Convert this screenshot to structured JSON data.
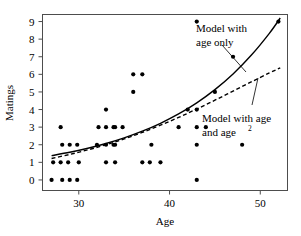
{
  "chart_data": {
    "type": "scatter",
    "title": "",
    "xlabel": "Age",
    "ylabel": "Matings",
    "xlim": [
      26,
      53
    ],
    "ylim": [
      -0.6,
      9.4
    ],
    "xticks": [
      30,
      40,
      50
    ],
    "xtick_labels": [
      "30",
      "40",
      "50"
    ],
    "yticks": [
      0,
      1,
      2,
      3,
      4,
      5,
      6,
      7,
      8,
      9
    ],
    "ytick_labels": [
      "0",
      "1",
      "2",
      "3",
      "4",
      "5",
      "6",
      "7",
      "8",
      "9"
    ],
    "grid": false,
    "legend": "annotations",
    "points": [
      {
        "x": 27,
        "y": 0
      },
      {
        "x": 28,
        "y": 1
      },
      {
        "x": 28,
        "y": 1
      },
      {
        "x": 28,
        "y": 1
      },
      {
        "x": 28,
        "y": 3
      },
      {
        "x": 29,
        "y": 0
      },
      {
        "x": 29,
        "y": 0
      },
      {
        "x": 29,
        "y": 0
      },
      {
        "x": 29,
        "y": 2
      },
      {
        "x": 29,
        "y": 2
      },
      {
        "x": 29,
        "y": 2
      },
      {
        "x": 30,
        "y": 1
      },
      {
        "x": 32,
        "y": 2
      },
      {
        "x": 33,
        "y": 4
      },
      {
        "x": 33,
        "y": 3
      },
      {
        "x": 33,
        "y": 3
      },
      {
        "x": 33,
        "y": 3
      },
      {
        "x": 33,
        "y": 2
      },
      {
        "x": 33,
        "y": 2
      },
      {
        "x": 33,
        "y": 1
      },
      {
        "x": 34,
        "y": 1
      },
      {
        "x": 34,
        "y": 2
      },
      {
        "x": 34,
        "y": 3
      },
      {
        "x": 34,
        "y": 3
      },
      {
        "x": 36,
        "y": 5
      },
      {
        "x": 36,
        "y": 6
      },
      {
        "x": 37,
        "y": 1
      },
      {
        "x": 37,
        "y": 1
      },
      {
        "x": 37,
        "y": 6
      },
      {
        "x": 38,
        "y": 2
      },
      {
        "x": 39,
        "y": 1
      },
      {
        "x": 41,
        "y": 3
      },
      {
        "x": 42,
        "y": 4
      },
      {
        "x": 43,
        "y": 0
      },
      {
        "x": 43,
        "y": 2
      },
      {
        "x": 43,
        "y": 3
      },
      {
        "x": 43,
        "y": 4
      },
      {
        "x": 43,
        "y": 9
      },
      {
        "x": 44,
        "y": 3
      },
      {
        "x": 45,
        "y": 5
      },
      {
        "x": 47,
        "y": 7
      },
      {
        "x": 48,
        "y": 2
      },
      {
        "x": 52,
        "y": 9
      }
    ],
    "curves": [
      {
        "name": "Model with age only",
        "style": "solid",
        "label_lines": [
          "Model with",
          "age only"
        ],
        "xrange": [
          27.0,
          52.2
        ],
        "points": [
          {
            "x": 27.0,
            "y": 1.38
          },
          {
            "x": 29.0,
            "y": 1.57
          },
          {
            "x": 31.0,
            "y": 1.8
          },
          {
            "x": 33.0,
            "y": 2.07
          },
          {
            "x": 35.0,
            "y": 2.39
          },
          {
            "x": 37.0,
            "y": 2.77
          },
          {
            "x": 39.0,
            "y": 3.22
          },
          {
            "x": 41.0,
            "y": 3.75
          },
          {
            "x": 43.0,
            "y": 4.38
          },
          {
            "x": 45.0,
            "y": 5.13
          },
          {
            "x": 47.0,
            "y": 6.02
          },
          {
            "x": 49.0,
            "y": 7.08
          },
          {
            "x": 51.0,
            "y": 8.33
          },
          {
            "x": 52.2,
            "y": 9.2
          }
        ]
      },
      {
        "name": "Model with age and age squared",
        "style": "dashed",
        "label_lines": [
          "Model with age",
          "and age"
        ],
        "label_superscript": "2",
        "xrange": [
          27.0,
          52.2
        ],
        "points": [
          {
            "x": 27.0,
            "y": 1.22
          },
          {
            "x": 29.0,
            "y": 1.45
          },
          {
            "x": 31.0,
            "y": 1.71
          },
          {
            "x": 33.0,
            "y": 2.0
          },
          {
            "x": 35.0,
            "y": 2.33
          },
          {
            "x": 37.0,
            "y": 2.7
          },
          {
            "x": 39.0,
            "y": 3.11
          },
          {
            "x": 41.0,
            "y": 3.55
          },
          {
            "x": 43.0,
            "y": 4.03
          },
          {
            "x": 45.0,
            "y": 4.53
          },
          {
            "x": 47.0,
            "y": 5.05
          },
          {
            "x": 49.0,
            "y": 5.57
          },
          {
            "x": 51.0,
            "y": 6.08
          },
          {
            "x": 52.2,
            "y": 6.37
          }
        ]
      }
    ],
    "annotations": [
      {
        "id": "annotation-age-only",
        "lines": [
          "Model with",
          "age only"
        ],
        "leader_from": {
          "x": 222,
          "y": 45
        },
        "leader_to": {
          "x": 246,
          "y": 72
        }
      },
      {
        "id": "annotation-age-and-age-squared",
        "lines": [
          "Model with age",
          "and age"
        ],
        "superscript": "2",
        "leader_from": {
          "x": 258,
          "y": 78
        },
        "leader_to": {
          "x": 252,
          "y": 105
        }
      }
    ]
  },
  "axes": {
    "x_title": "Age",
    "y_title": "Matings",
    "x_tick_labels": [
      "30",
      "40",
      "50"
    ],
    "y_tick_labels": [
      "0",
      "1",
      "2",
      "3",
      "4",
      "5",
      "6",
      "7",
      "8",
      "9"
    ]
  },
  "annotations": {
    "age_only": {
      "line1": "Model with",
      "line2": "age only"
    },
    "age_and_age2": {
      "line1": "Model with age",
      "line2": "and age",
      "superscript": "2"
    }
  },
  "colors": {
    "background": "#ffffff",
    "frame": "#4d4d4d",
    "point": "#000000",
    "curve": "#000000",
    "text": "#000000"
  }
}
